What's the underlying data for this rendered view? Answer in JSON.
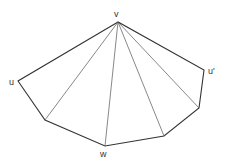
{
  "diagram": {
    "type": "fan-triangulation",
    "colors": {
      "edge": "#333333",
      "diagonal": "#555555",
      "label": "#333333"
    },
    "vertices": [
      {
        "id": "v",
        "label": "v",
        "x": 118,
        "y": 22
      },
      {
        "id": "u",
        "label": "u",
        "x": 18,
        "y": 81
      },
      {
        "id": "a",
        "label": "",
        "x": 45,
        "y": 120
      },
      {
        "id": "w",
        "label": "w",
        "x": 105,
        "y": 146
      },
      {
        "id": "b",
        "label": "",
        "x": 164,
        "y": 136
      },
      {
        "id": "c",
        "label": "",
        "x": 199,
        "y": 108
      },
      {
        "id": "u2",
        "label": "u'",
        "x": 204,
        "y": 70
      }
    ],
    "boundary": [
      "v",
      "u",
      "a",
      "w",
      "b",
      "c",
      "u2",
      "v"
    ],
    "diagonals": [
      [
        "v",
        "a"
      ],
      [
        "v",
        "w"
      ],
      [
        "v",
        "b"
      ],
      [
        "v",
        "c"
      ]
    ],
    "labels": {
      "v": {
        "text": "v",
        "x": 114,
        "y": 17
      },
      "u": {
        "text": "u",
        "x": 9,
        "y": 85
      },
      "u2": {
        "text": "u'",
        "x": 208,
        "y": 74
      },
      "w": {
        "text": "w",
        "x": 100,
        "y": 157
      }
    }
  }
}
